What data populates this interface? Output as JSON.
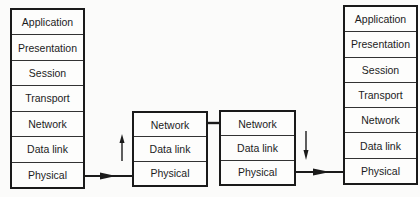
{
  "diagram": {
    "type": "osi-routing",
    "host_a": {
      "layers": [
        "Application",
        "Presentation",
        "Session",
        "Transport",
        "Network",
        "Data link",
        "Physical"
      ]
    },
    "router_1": {
      "layers": [
        "Network",
        "Data link",
        "Physical"
      ]
    },
    "router_2": {
      "layers": [
        "Network",
        "Data link",
        "Physical"
      ]
    },
    "host_b": {
      "layers": [
        "Application",
        "Presentation",
        "Session",
        "Transport",
        "Network",
        "Data link",
        "Physical"
      ]
    },
    "connections": [
      {
        "from": "host_a.Physical",
        "to": "router_1.Physical",
        "arrow": "right"
      },
      {
        "from": "router_1",
        "direction": "up",
        "arrow": "up"
      },
      {
        "from": "router_1.Network",
        "to": "router_2.Network",
        "arrow": "none"
      },
      {
        "from": "router_2",
        "direction": "down",
        "arrow": "down"
      },
      {
        "from": "router_2.Physical",
        "to": "host_b.Physical",
        "arrow": "right"
      }
    ],
    "colors": {
      "line": "#1a1a1a",
      "background": "#fbfbfa"
    }
  }
}
